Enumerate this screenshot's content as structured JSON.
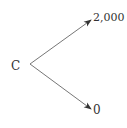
{
  "diagram": {
    "type": "tree",
    "root": {
      "label": "C"
    },
    "branches": [
      {
        "label": "2,000",
        "direction": "up"
      },
      {
        "label": "0",
        "direction": "down"
      }
    ],
    "colors": {
      "line": "#555555",
      "text": "#333333"
    }
  }
}
